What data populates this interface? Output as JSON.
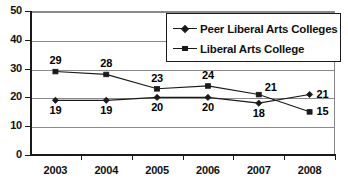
{
  "chart_data": {
    "type": "line",
    "title": "",
    "xlabel": "",
    "ylabel": "",
    "categories": [
      "2003",
      "2004",
      "2005",
      "2006",
      "2007",
      "2008"
    ],
    "ylim": [
      0,
      50
    ],
    "ytick_labels": [
      "50",
      "40",
      "30",
      "20",
      "10",
      "0"
    ],
    "ytick_values": [
      50,
      40,
      30,
      20,
      10,
      0
    ],
    "grid": true,
    "legend_position": "top-right",
    "series": [
      {
        "name": "Peer Liberal Arts Colleges",
        "marker": "diamond",
        "values": [
          19,
          19,
          20,
          20,
          18,
          21
        ],
        "labels": [
          "19",
          "19",
          "20",
          "20",
          "18",
          "21"
        ]
      },
      {
        "name": "Liberal Arts College",
        "marker": "square",
        "values": [
          29,
          28,
          23,
          24,
          21,
          15
        ],
        "labels": [
          "29",
          "28",
          "23",
          "24",
          "21",
          "15"
        ]
      }
    ]
  },
  "legend": {
    "items": [
      {
        "label": "Peer Liberal Arts Colleges",
        "marker": "diamond"
      },
      {
        "label": "Liberal Arts College",
        "marker": "square"
      }
    ]
  },
  "colors": {
    "series_line": "#1a1a1a",
    "gridline": "#8a8a8a",
    "axis": "#1a1a1a",
    "text": "#111111",
    "background": "#ffffff"
  }
}
